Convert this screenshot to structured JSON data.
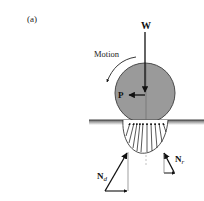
{
  "figure": {
    "panel_label": "(a)",
    "labels": {
      "weight": "W",
      "motion": "Motion",
      "force_p": "P",
      "normal_d_main": "N",
      "normal_d_sub": "d",
      "normal_r_main": "N",
      "normal_r_sub": "r"
    },
    "colors": {
      "wheel_fill": "#9a9a9a",
      "wheel_stroke": "#4a4a4a",
      "ground": "#555555",
      "arrows": "#111111",
      "background": "#ffffff"
    }
  }
}
